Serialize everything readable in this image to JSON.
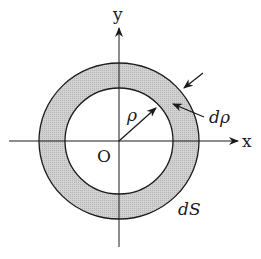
{
  "diagram": {
    "type": "annulus-area-element",
    "labels": {
      "y_axis": "y",
      "x_axis": "x",
      "origin": "O",
      "radius": "ρ",
      "thickness": "dρ",
      "area": "dS"
    },
    "colors": {
      "ring_fill": "#c8c8c8",
      "stroke": "#1a1a1a",
      "background": "#ffffff"
    },
    "geometry": {
      "center": [
        119,
        141
      ],
      "outer_radius": 79,
      "inner_radius": 54
    }
  }
}
